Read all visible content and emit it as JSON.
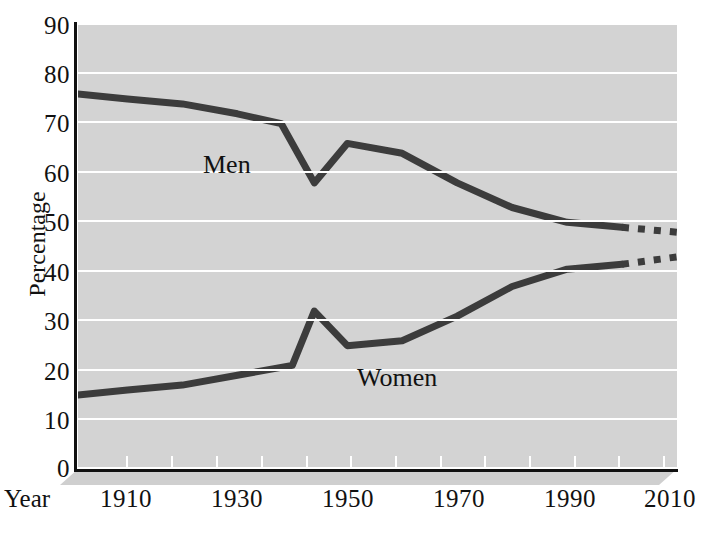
{
  "chart_data": {
    "type": "line",
    "title": "",
    "xlabel": "Year",
    "ylabel": "Percentage",
    "xlim": [
      1901,
      2010
    ],
    "ylim": [
      0,
      90
    ],
    "grid": true,
    "legend_position": "inline-annotations",
    "x_ticks": [
      1910,
      1920,
      1930,
      1940,
      1950,
      1960,
      1970,
      1980,
      1990,
      2000,
      2010
    ],
    "x_tick_labels": [
      "1910",
      "1930",
      "1950",
      "1970",
      "1990",
      "2010"
    ],
    "x_major_labels": [
      {
        "year": 1910,
        "label": "1910"
      },
      {
        "year": 1930,
        "label": "1930"
      },
      {
        "year": 1950,
        "label": "1950"
      },
      {
        "year": 1970,
        "label": "1970"
      },
      {
        "year": 1990,
        "label": "1990"
      },
      {
        "year": 2010,
        "label": "2010"
      }
    ],
    "y_ticks": [
      0,
      10,
      20,
      30,
      40,
      50,
      60,
      70,
      80,
      90
    ],
    "y_tick_labels": [
      "0",
      "10",
      "20",
      "30",
      "40",
      "50",
      "60",
      "70",
      "80",
      "90"
    ],
    "series": [
      {
        "name": "Men",
        "label": "Men",
        "color": "#3c3c3c",
        "style": "solid",
        "x": [
          1901,
          1910,
          1920,
          1930,
          1938,
          1944,
          1950,
          1960,
          1970,
          1980,
          1990,
          2000
        ],
        "values": [
          76,
          75,
          74,
          72,
          70,
          58,
          66,
          64,
          58,
          53,
          50,
          49
        ]
      },
      {
        "name": "Men projection",
        "label": "Men",
        "color": "#3c3c3c",
        "style": "dashed",
        "x": [
          2000,
          2010
        ],
        "values": [
          49,
          48
        ]
      },
      {
        "name": "Women",
        "label": "Women",
        "color": "#3c3c3c",
        "style": "solid",
        "x": [
          1901,
          1910,
          1920,
          1930,
          1940,
          1944,
          1950,
          1960,
          1970,
          1980,
          1990,
          2000
        ],
        "values": [
          15,
          16,
          17,
          19,
          21,
          32,
          25,
          26,
          31,
          37,
          40.5,
          41.5
        ]
      },
      {
        "name": "Women projection",
        "label": "Women",
        "color": "#3c3c3c",
        "style": "dashed",
        "x": [
          2000,
          2010
        ],
        "values": [
          41.5,
          43
        ]
      }
    ],
    "annotations": [
      {
        "text": "Men",
        "x": 1923,
        "y": 63
      },
      {
        "text": "Women",
        "x": 1951,
        "y": 20
      }
    ]
  },
  "axes": {
    "y_title": "Percentage",
    "x_title": "Year"
  },
  "colors": {
    "plot_background": "#d3d3d3",
    "gridline": "#ffffff",
    "line": "#3c3c3c",
    "axis": "#111111",
    "page_background": "#ffffff"
  }
}
